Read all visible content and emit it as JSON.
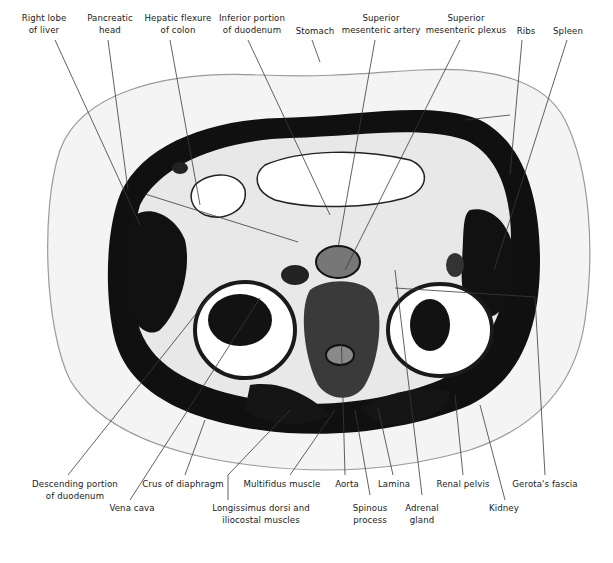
{
  "figure": {
    "type": "anatomical cross-section",
    "colors": {
      "background": "#ffffff",
      "tissue_dark": "#0b0b0b",
      "tissue_mid": "#6e6e6e",
      "fat_light": "#f1f1f1",
      "text": "#1a1a1a",
      "leader": "#3a3a3a"
    }
  },
  "labels_top": [
    {
      "id": "right-lobe-of-liver",
      "line1": "Right lobe",
      "line2": "of liver",
      "x": 44,
      "y": 12
    },
    {
      "id": "pancreatic-head",
      "line1": "Pancreatic",
      "line2": "head",
      "x": 108,
      "y": 12
    },
    {
      "id": "hepatic-flexure-of-colon",
      "line1": "Hepatic flexure",
      "line2": "of colon",
      "x": 180,
      "y": 12
    },
    {
      "id": "inferior-portion-of-duodenum",
      "line1": "Inferior portion",
      "line2": "of duodenum",
      "x": 252,
      "y": 12
    },
    {
      "id": "stomach",
      "line1": "Stomach",
      "line2": "",
      "x": 316,
      "y": 26
    },
    {
      "id": "superior-mesenteric-artery",
      "line1": "Superior",
      "line2": "mesenteric artery",
      "x": 382,
      "y": 12
    },
    {
      "id": "superior-mesenteric-plexus",
      "line1": "Superior",
      "line2": "mesenteric plexus",
      "x": 466,
      "y": 12
    },
    {
      "id": "ribs",
      "line1": "Ribs",
      "line2": "",
      "x": 525,
      "y": 26
    },
    {
      "id": "spleen",
      "line1": "Spleen",
      "line2": "",
      "x": 568,
      "y": 26
    }
  ],
  "labels_bottom": [
    {
      "id": "descending-portion-of-duodenum",
      "line1": "Descending portion",
      "line2": "of duodenum",
      "x": 75,
      "y": 479
    },
    {
      "id": "vena-cava",
      "line1": "Vena cava",
      "line2": "",
      "x": 132,
      "y": 505
    },
    {
      "id": "crus-of-diaphragm",
      "line1": "Crus of diaphragm",
      "line2": "",
      "x": 183,
      "y": 479
    },
    {
      "id": "longissimus-dorsi-and-iliocostal-muscles",
      "line1": "Longissimus dorsi and",
      "line2": "iliocostal muscles",
      "x": 261,
      "y": 505
    },
    {
      "id": "multifidus-muscle",
      "line1": "Multifidus muscle",
      "line2": "",
      "x": 282,
      "y": 479
    },
    {
      "id": "aorta",
      "line1": "Aorta",
      "line2": "",
      "x": 347,
      "y": 479
    },
    {
      "id": "spinous-process",
      "line1": "Spinous",
      "line2": "process",
      "x": 370,
      "y": 505
    },
    {
      "id": "lamina",
      "line1": "Lamina",
      "line2": "",
      "x": 394,
      "y": 479
    },
    {
      "id": "adrenal-gland",
      "line1": "Adrenal",
      "line2": "gland",
      "x": 422,
      "y": 505
    },
    {
      "id": "renal-pelvis",
      "line1": "Renal pelvis",
      "line2": "",
      "x": 463,
      "y": 479
    },
    {
      "id": "kidney",
      "line1": "Kidney",
      "line2": "",
      "x": 504,
      "y": 505
    },
    {
      "id": "gerotas-fascia",
      "line1": "Gerota's fascia",
      "line2": "",
      "x": 545,
      "y": 479
    }
  ]
}
